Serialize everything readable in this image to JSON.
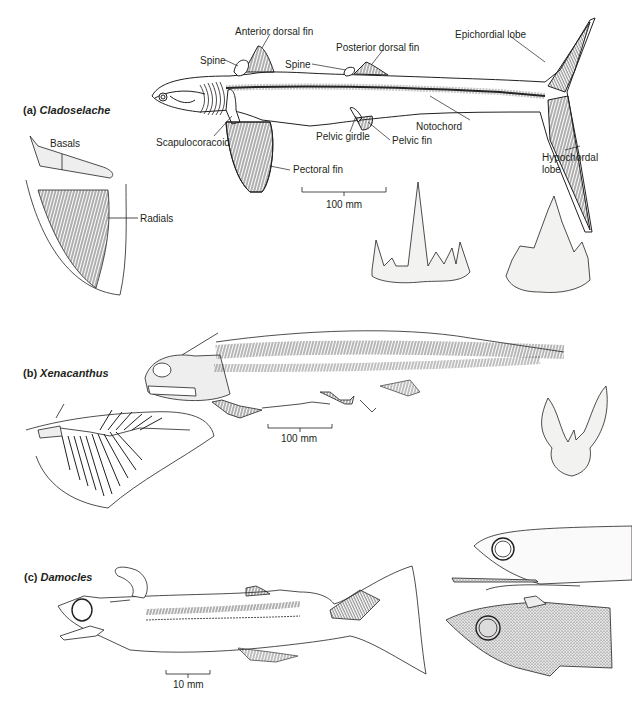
{
  "figure": {
    "panels": [
      {
        "id": "a",
        "letter": "(a)",
        "genus": "Cladoselache",
        "labels": {
          "anterior_dorsal_fin": "Anterior dorsal fin",
          "spine_1": "Spine",
          "spine_2": "Spine",
          "posterior_dorsal_fin": "Posterior dorsal fin",
          "epichordial_lobe": "Epichordial lobe",
          "notochord": "Notochord",
          "scapulocoracoid": "Scapulocoracoid",
          "pelvic_girdle": "Pelvic girdle",
          "pelvic_fin": "Pelvic fin",
          "pectoral_fin": "Pectoral fin",
          "hypochordal_lobe_1": "Hypochordal",
          "hypochordal_lobe_2": "lobe",
          "basals": "Basals",
          "radials": "Radials"
        },
        "scale_bar": "100 mm"
      },
      {
        "id": "b",
        "letter": "(b)",
        "genus": "Xenacanthus",
        "scale_bar": "100 mm"
      },
      {
        "id": "c",
        "letter": "(c)",
        "genus": "Damocles",
        "scale_bar": "10 mm"
      }
    ]
  }
}
